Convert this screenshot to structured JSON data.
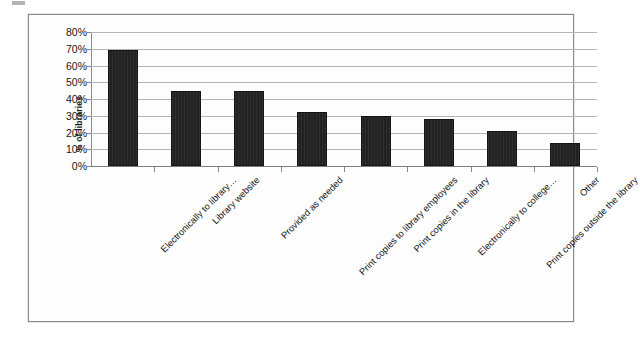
{
  "chart_data": {
    "type": "bar",
    "title": "",
    "xlabel": "",
    "ylabel": "% of libraries",
    "ylim": [
      0,
      80
    ],
    "grid": true,
    "legend": "none",
    "bar_color": "#222222",
    "gridline_color": "#b4b4b4",
    "axis_color": "#8a8a8a",
    "yticks": [
      "80%",
      "70%",
      "60%",
      "50%",
      "40%",
      "30%",
      "20%",
      "10%",
      "0%"
    ],
    "ytick_values": [
      80,
      70,
      60,
      50,
      40,
      30,
      20,
      10,
      0
    ],
    "categories": [
      "Electronically to library…",
      "Library website",
      "Provided as needed",
      "Print copies to library employees",
      "Print copies in the library",
      "Electronically to college…",
      "Print copies outside the library",
      "Other"
    ],
    "values": [
      69,
      45,
      45,
      32,
      30,
      28,
      21,
      14
    ]
  }
}
